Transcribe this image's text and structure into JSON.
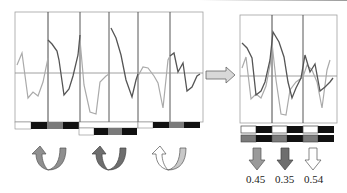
{
  "figure": {
    "left_panel": {
      "segments": 6,
      "grid_color": "#333333",
      "border_color": "#999999",
      "light_series_color": "#a8a8a8",
      "dark_series_color": "#555555",
      "bars": {
        "row1_a": [
          "white",
          "black",
          "gray",
          "black"
        ],
        "row2": [
          "white",
          "black",
          "gray",
          "black"
        ],
        "row1_b": [
          "white",
          "black",
          "gray",
          "black"
        ]
      },
      "cycle_arrows": [
        {
          "name": "rotation-arrow-1",
          "fill": "#8f8f8f"
        },
        {
          "name": "rotation-arrow-2",
          "fill": "#6e6e6e"
        },
        {
          "name": "rotation-arrow-3",
          "fill": "#ffffff"
        }
      ]
    },
    "transition_arrow": {
      "direction": "right",
      "fill": "#d8d8d8"
    },
    "right_panel": {
      "segments": 3,
      "bars": {
        "row1": [
          "white",
          "black",
          "white",
          "black",
          "white",
          "black"
        ],
        "row2": [
          "gray",
          "black",
          "gray",
          "black",
          "gray",
          "black"
        ]
      },
      "down_arrows": [
        {
          "fill": "#9a9a9a",
          "value": "0.45"
        },
        {
          "fill": "#6e6e6e",
          "value": "0.35"
        },
        {
          "fill": "#ffffff",
          "value": "0.54"
        }
      ]
    }
  },
  "labels": {
    "value_1": "0.45",
    "value_2": "0.35",
    "value_3": "0.54"
  }
}
